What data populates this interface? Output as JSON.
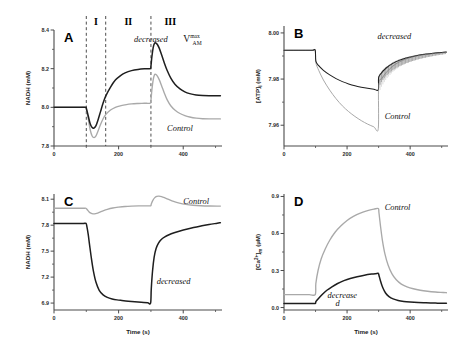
{
  "figure": {
    "name": "four-panel-simulation-figure",
    "background": "#ffffff",
    "colors": {
      "control_trace": "#a9a9a9",
      "decreased_trace": "#1e1e1e",
      "axis": "#4a4a4a",
      "dashed_divider": "#3a3a3a"
    }
  },
  "chart_data": [
    {
      "type": "line",
      "panel": "A",
      "letter": "A",
      "title": "",
      "xlabel": "",
      "ylabel": "NADH (mM)",
      "xlim": [
        0,
        520
      ],
      "ylim": [
        7.8,
        8.4
      ],
      "xticks": [
        0,
        200,
        400
      ],
      "xticklabels": [
        "0",
        "200",
        "400"
      ],
      "xminorticks": [
        100,
        300,
        500
      ],
      "yticks": [
        7.8,
        8.0,
        8.2,
        8.4
      ],
      "yticklabels": [
        "7.8",
        "8.0",
        "8.2",
        "8.4"
      ],
      "yminorticks": [
        7.9,
        8.1,
        8.3
      ],
      "grid": false,
      "phase_labels": [
        "I",
        "II",
        "III"
      ],
      "phase_dividers": [
        100,
        160,
        300
      ],
      "annotations": [
        {
          "text": "decreased",
          "style": "italic",
          "x": 300,
          "y": 8.34
        },
        {
          "text": "V",
          "sub": "AM",
          "sup": "max",
          "style": "serif",
          "x": 400,
          "y": 8.34
        },
        {
          "text": "Control",
          "style": "italic",
          "x": 390,
          "y": 7.88
        }
      ],
      "series": [
        {
          "name": "decreased",
          "color": "#1e1e1e",
          "x": [
            0,
            20,
            40,
            60,
            80,
            98,
            100,
            106,
            112,
            118,
            124,
            130,
            136,
            144,
            152,
            160,
            175,
            190,
            205,
            220,
            240,
            260,
            280,
            298,
            300,
            303,
            307,
            311,
            315,
            320,
            326,
            333,
            341,
            350,
            362,
            375,
            390,
            405,
            420,
            440,
            460,
            480,
            500,
            515
          ],
          "y": [
            8.0,
            8.0,
            8.0,
            8.0,
            8.0,
            8.0,
            7.995,
            7.955,
            7.915,
            7.896,
            7.893,
            7.905,
            7.933,
            7.978,
            8.022,
            8.058,
            8.105,
            8.141,
            8.163,
            8.178,
            8.19,
            8.196,
            8.199,
            8.2,
            8.212,
            8.262,
            8.309,
            8.331,
            8.333,
            8.325,
            8.305,
            8.272,
            8.232,
            8.192,
            8.15,
            8.118,
            8.095,
            8.08,
            8.071,
            8.064,
            8.061,
            8.06,
            8.06,
            8.06
          ]
        },
        {
          "name": "Control",
          "color": "#a9a9a9",
          "x": [
            0,
            20,
            40,
            60,
            80,
            98,
            100,
            106,
            112,
            118,
            124,
            130,
            136,
            144,
            152,
            160,
            175,
            190,
            205,
            220,
            240,
            260,
            280,
            298,
            300,
            303,
            307,
            311,
            315,
            320,
            326,
            333,
            341,
            350,
            362,
            375,
            390,
            405,
            420,
            440,
            460,
            480,
            500,
            515
          ],
          "y": [
            8.0,
            8.0,
            8.0,
            8.0,
            8.0,
            8.0,
            7.992,
            7.94,
            7.884,
            7.852,
            7.843,
            7.852,
            7.876,
            7.911,
            7.941,
            7.962,
            7.986,
            8.0,
            8.008,
            8.013,
            8.018,
            8.02,
            8.021,
            8.022,
            8.035,
            8.09,
            8.142,
            8.168,
            8.17,
            8.162,
            8.142,
            8.112,
            8.076,
            8.04,
            8.007,
            7.985,
            7.968,
            7.957,
            7.95,
            7.944,
            7.941,
            7.94,
            7.94,
            7.94
          ]
        }
      ]
    },
    {
      "type": "line",
      "panel": "B",
      "letter": "B",
      "title": "",
      "xlabel": "",
      "ylabel": "[ATP]i (mM)",
      "xlim": [
        0,
        520
      ],
      "ylim": [
        7.951,
        8.003
      ],
      "xticks": [
        0,
        200,
        400
      ],
      "xticklabels": [
        "0",
        "200",
        "400"
      ],
      "xminorticks": [
        100,
        300,
        500
      ],
      "yticks": [
        7.96,
        7.98,
        8.0
      ],
      "yticklabels": [
        "7.96",
        "7.98",
        "8.00"
      ],
      "yminorticks": [
        7.97,
        7.99
      ],
      "grid": false,
      "annotations": [
        {
          "text": "decreased",
          "style": "italic",
          "x": 350,
          "y": 7.9975
        },
        {
          "text": "Control",
          "style": "italic",
          "x": 360,
          "y": 7.9625
        }
      ],
      "oscillation": {
        "start": 300,
        "end": 515,
        "period": 4.5,
        "amplitude_start": 0.0045,
        "amplitude_end": 0.0008,
        "series": "decreased"
      },
      "series": [
        {
          "name": "decreased",
          "color": "#1e1e1e",
          "x": [
            0,
            30,
            60,
            90,
            99,
            101,
            110,
            125,
            145,
            165,
            185,
            205,
            225,
            245,
            265,
            285,
            299,
            300,
            310,
            325,
            345,
            365,
            385,
            405,
            430,
            455,
            480,
            505,
            515
          ],
          "y": [
            7.9925,
            7.9925,
            7.9925,
            7.9925,
            7.9925,
            7.9878,
            7.9858,
            7.9838,
            7.9818,
            7.9802,
            7.9789,
            7.9779,
            7.9771,
            7.9765,
            7.976,
            7.9756,
            7.9754,
            7.9806,
            7.9828,
            7.9849,
            7.9868,
            7.9881,
            7.989,
            7.9897,
            7.9904,
            7.9909,
            7.9913,
            7.9916,
            7.9917
          ]
        },
        {
          "name": "Control",
          "color": "#a9a9a9",
          "x": [
            0,
            30,
            60,
            90,
            99,
            101,
            110,
            125,
            145,
            165,
            185,
            205,
            225,
            245,
            265,
            285,
            299,
            300,
            310,
            325,
            345,
            365,
            385,
            405,
            430,
            455,
            480,
            505,
            515
          ],
          "y": [
            7.9925,
            7.9925,
            7.9925,
            7.9925,
            7.9925,
            7.9872,
            7.9838,
            7.9796,
            7.9752,
            7.9715,
            7.9684,
            7.9659,
            7.9638,
            7.962,
            7.9605,
            7.9593,
            7.9586,
            7.9775,
            7.9802,
            7.983,
            7.9856,
            7.9874,
            7.9886,
            7.9895,
            7.9903,
            7.9908,
            7.9912,
            7.9915,
            7.9916
          ]
        }
      ]
    },
    {
      "type": "line",
      "panel": "C",
      "letter": "C",
      "title": "",
      "xlabel": "Time (s)",
      "ylabel": "NADH (mM)",
      "xlim": [
        0,
        520
      ],
      "ylim": [
        6.82,
        8.16
      ],
      "xticks": [
        0,
        200,
        400
      ],
      "xticklabels": [
        "0",
        "200",
        "400"
      ],
      "xminorticks": [
        100,
        300,
        500
      ],
      "yticks": [
        6.9,
        7.2,
        7.5,
        7.8,
        8.1
      ],
      "yticklabels": [
        "6.9",
        "7.2",
        "7.5",
        "7.8",
        "8.1"
      ],
      "yminorticks": [
        7.05,
        7.35,
        7.65,
        7.95
      ],
      "grid": false,
      "annotations": [
        {
          "text": "Control",
          "style": "italic",
          "x": 440,
          "y": 8.04
        },
        {
          "text": "decreased",
          "style": "italic",
          "x": 370,
          "y": 7.12
        }
      ],
      "series": [
        {
          "name": "decreased",
          "color": "#1e1e1e",
          "x": [
            0,
            30,
            60,
            90,
            99,
            102,
            106,
            110,
            116,
            122,
            130,
            140,
            152,
            165,
            180,
            195,
            210,
            230,
            250,
            270,
            290,
            299,
            301,
            305,
            310,
            316,
            323,
            332,
            343,
            356,
            372,
            390,
            410,
            432,
            455,
            480,
            505,
            515
          ],
          "y": [
            7.82,
            7.82,
            7.82,
            7.82,
            7.82,
            7.78,
            7.69,
            7.575,
            7.41,
            7.27,
            7.14,
            7.048,
            6.995,
            6.966,
            6.948,
            6.937,
            6.93,
            6.922,
            6.915,
            6.909,
            6.903,
            6.9,
            7.06,
            7.27,
            7.43,
            7.53,
            7.59,
            7.635,
            7.665,
            7.69,
            7.712,
            7.732,
            7.752,
            7.772,
            7.79,
            7.808,
            7.822,
            7.828
          ]
        },
        {
          "name": "Control",
          "color": "#a9a9a9",
          "x": [
            0,
            30,
            60,
            90,
            99,
            103,
            108,
            114,
            121,
            129,
            138,
            150,
            165,
            182,
            200,
            220,
            240,
            262,
            285,
            299,
            301,
            306,
            312,
            318,
            325,
            333,
            343,
            355,
            370,
            388,
            408,
            430,
            455,
            482,
            505,
            515
          ],
          "y": [
            7.995,
            7.995,
            7.995,
            7.995,
            7.995,
            7.978,
            7.955,
            7.938,
            7.93,
            7.933,
            7.944,
            7.962,
            7.982,
            7.998,
            8.008,
            8.016,
            8.02,
            8.022,
            8.023,
            8.024,
            8.045,
            8.086,
            8.118,
            8.133,
            8.136,
            8.13,
            8.116,
            8.097,
            8.075,
            8.055,
            8.04,
            8.03,
            8.024,
            8.021,
            8.02,
            8.02
          ]
        }
      ]
    },
    {
      "type": "line",
      "panel": "D",
      "letter": "D",
      "title": "",
      "xlabel": "Time (s)",
      "ylabel": "[Ca2+]m (uM)",
      "xlim": [
        0,
        520
      ],
      "ylim": [
        -0.02,
        0.92
      ],
      "xticks": [
        0,
        200,
        400
      ],
      "xticklabels": [
        "0",
        "200",
        "400"
      ],
      "xminorticks": [
        100,
        300,
        500
      ],
      "yticks": [
        0.0,
        0.3,
        0.6,
        0.9
      ],
      "yticklabels": [
        "0.0",
        "0.3",
        "0.6",
        "0.9"
      ],
      "yminorticks": [
        0.15,
        0.45,
        0.75
      ],
      "grid": false,
      "annotations": [
        {
          "text": "Control",
          "style": "italic",
          "x": 360,
          "y": 0.79
        },
        {
          "text": "decrease",
          "style": "italic",
          "x": 185,
          "y": 0.075
        },
        {
          "text": "d",
          "style": "italic",
          "x": 170,
          "y": 0.015
        }
      ],
      "series": [
        {
          "name": "Control",
          "color": "#a9a9a9",
          "x": [
            0,
            40,
            80,
            99,
            101,
            108,
            118,
            130,
            145,
            162,
            180,
            200,
            220,
            242,
            265,
            285,
            299,
            301,
            306,
            312,
            320,
            330,
            342,
            356,
            372,
            390,
            410,
            432,
            455,
            480,
            505,
            515
          ],
          "y": [
            0.105,
            0.105,
            0.105,
            0.105,
            0.195,
            0.3,
            0.395,
            0.47,
            0.545,
            0.61,
            0.66,
            0.705,
            0.738,
            0.765,
            0.785,
            0.797,
            0.803,
            0.77,
            0.66,
            0.545,
            0.435,
            0.345,
            0.275,
            0.225,
            0.19,
            0.168,
            0.152,
            0.14,
            0.132,
            0.126,
            0.122,
            0.12
          ]
        },
        {
          "name": "decreased",
          "color": "#1e1e1e",
          "x": [
            0,
            40,
            80,
            99,
            101,
            110,
            122,
            136,
            152,
            170,
            190,
            210,
            232,
            255,
            278,
            295,
            299,
            301,
            306,
            313,
            322,
            333,
            346,
            362,
            380,
            400,
            425,
            450,
            480,
            505,
            515
          ],
          "y": [
            0.033,
            0.033,
            0.033,
            0.033,
            0.048,
            0.075,
            0.108,
            0.14,
            0.168,
            0.195,
            0.218,
            0.236,
            0.25,
            0.262,
            0.271,
            0.276,
            0.278,
            0.262,
            0.215,
            0.162,
            0.118,
            0.089,
            0.07,
            0.057,
            0.049,
            0.044,
            0.04,
            0.038,
            0.036,
            0.035,
            0.035
          ]
        }
      ]
    }
  ]
}
